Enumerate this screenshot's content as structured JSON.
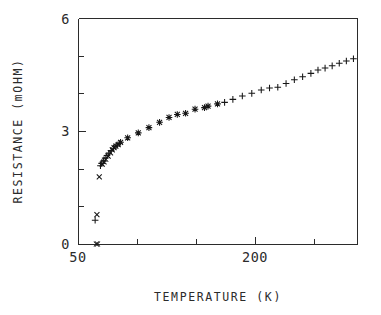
{
  "chart_data": {
    "type": "scatter",
    "title": "",
    "xlabel": "TEMPERATURE  (K)",
    "ylabel": "RESISTANCE  (mOHM)",
    "xlim": [
      50,
      286
    ],
    "ylim": [
      0,
      6
    ],
    "grid": false,
    "legend": "none",
    "x_ticks_major": [
      50,
      200
    ],
    "x_tick_labels": [
      "50",
      "200"
    ],
    "x_ticks_minor": [
      100,
      150,
      250
    ],
    "y_ticks_major": [
      0,
      3,
      6
    ],
    "y_tick_labels": [
      "0",
      "3",
      "6"
    ],
    "y_ticks_minor": [
      1,
      2,
      4,
      5
    ],
    "series": [
      {
        "name": "low-temperature transition (cross)",
        "marker": "cross",
        "points": [
          [
            65.5,
            0.0
          ],
          [
            66.5,
            0.0
          ],
          [
            66.0,
            0.78
          ],
          [
            68.0,
            1.78
          ],
          [
            70.5,
            2.12
          ],
          [
            72.0,
            2.18
          ],
          [
            73.5,
            2.25
          ],
          [
            75.5,
            2.33
          ],
          [
            77.5,
            2.42
          ],
          [
            79.0,
            2.5
          ],
          [
            80.5,
            2.56
          ],
          [
            82.0,
            2.6
          ],
          [
            84.0,
            2.64
          ]
        ]
      },
      {
        "name": "low-temperature transition (plus)",
        "marker": "plus",
        "points": [
          [
            64.5,
            0.63
          ],
          [
            69.0,
            2.08
          ],
          [
            70.0,
            2.14
          ],
          [
            71.5,
            2.2
          ],
          [
            73.0,
            2.28
          ],
          [
            74.5,
            2.35
          ],
          [
            76.0,
            2.41
          ],
          [
            78.0,
            2.48
          ],
          [
            80.0,
            2.54
          ],
          [
            81.5,
            2.59
          ],
          [
            83.0,
            2.63
          ],
          [
            85.0,
            2.67
          ]
        ]
      },
      {
        "name": "mid-range overlap (asterisk)",
        "marker": "asterisk",
        "points": [
          [
            86.0,
            2.7
          ],
          [
            92.0,
            2.82
          ],
          [
            101.0,
            2.95
          ],
          [
            110.0,
            3.09
          ],
          [
            119.0,
            3.23
          ],
          [
            127.0,
            3.36
          ],
          [
            134.0,
            3.44
          ],
          [
            141.0,
            3.47
          ],
          [
            149.0,
            3.58
          ],
          [
            157.0,
            3.62
          ],
          [
            160.0,
            3.66
          ],
          [
            168.0,
            3.72
          ]
        ]
      },
      {
        "name": "high-temperature branch (plus)",
        "marker": "plus",
        "points": [
          [
            174.0,
            3.76
          ],
          [
            181.0,
            3.84
          ],
          [
            189.0,
            3.93
          ],
          [
            197.0,
            4.0
          ],
          [
            205.0,
            4.09
          ],
          [
            212.0,
            4.14
          ],
          [
            219.0,
            4.16
          ],
          [
            226.0,
            4.26
          ],
          [
            233.0,
            4.36
          ],
          [
            240.0,
            4.44
          ],
          [
            247.0,
            4.53
          ],
          [
            253.0,
            4.62
          ],
          [
            259.0,
            4.67
          ],
          [
            265.0,
            4.73
          ],
          [
            271.0,
            4.8
          ],
          [
            277.0,
            4.86
          ],
          [
            283.0,
            4.92
          ]
        ]
      }
    ]
  },
  "geometry": {
    "plot_left_px": 78,
    "plot_right_px": 357,
    "plot_top_px": 18,
    "plot_bottom_px": 244
  }
}
